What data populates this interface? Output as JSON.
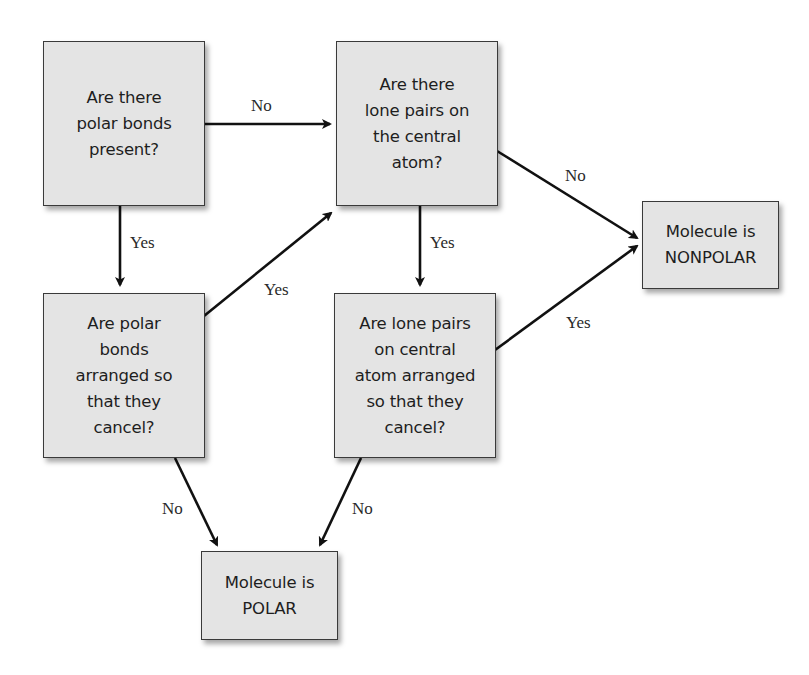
{
  "diagram": {
    "type": "flowchart",
    "nodes": [
      {
        "id": "q1",
        "label": "Are there\npolar bonds\npresent?"
      },
      {
        "id": "q2",
        "label": "Are there\nlone pairs on\nthe central\natom?"
      },
      {
        "id": "q3",
        "label": "Are polar\nbonds\narranged so\nthat they\ncancel?"
      },
      {
        "id": "q4",
        "label": "Are lone pairs\non central\natom arranged\nso that they\ncancel?"
      },
      {
        "id": "nonpolar",
        "label": "Molecule is\nNONPOLAR"
      },
      {
        "id": "polar",
        "label": "Molecule is\nPOLAR"
      }
    ],
    "edges": [
      {
        "from": "q1",
        "to": "q2",
        "label": "No"
      },
      {
        "from": "q1",
        "to": "q3",
        "label": "Yes"
      },
      {
        "from": "q3",
        "to": "q2",
        "label": "Yes"
      },
      {
        "from": "q2",
        "to": "nonpolar",
        "label": "No"
      },
      {
        "from": "q2",
        "to": "q4",
        "label": "Yes"
      },
      {
        "from": "q4",
        "to": "nonpolar",
        "label": "Yes"
      },
      {
        "from": "q3",
        "to": "polar",
        "label": "No"
      },
      {
        "from": "q4",
        "to": "polar",
        "label": "No"
      }
    ]
  },
  "colors": {
    "node_fill": "#e4e4e4",
    "node_border": "#3a3a3a",
    "arrow": "#111111",
    "text": "#1e1e1e"
  }
}
